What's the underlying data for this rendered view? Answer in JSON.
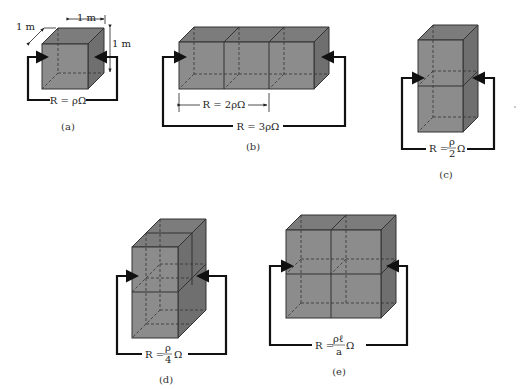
{
  "figure": {
    "panels": [
      {
        "id": "a",
        "caption": "(a)",
        "description": "single 1 m cube",
        "dimensions": {
          "width": "1 m",
          "depth": "1 m",
          "height": "1 m"
        },
        "resistance_label": "R = ρΩ"
      },
      {
        "id": "b",
        "caption": "(b)",
        "description": "three cubes in series",
        "inner_label": "R = 2ρΩ",
        "resistance_label": "R = 3ρΩ"
      },
      {
        "id": "c",
        "caption": "(c)",
        "description": "two cubes stacked in parallel",
        "resistance_label_prefix": "R =",
        "resistance_numerator": "ρ",
        "resistance_denominator": "2",
        "resistance_unit": "Ω"
      },
      {
        "id": "d",
        "caption": "(d)",
        "description": "four cubes in parallel (2 high × 2 deep)",
        "resistance_label_prefix": "R =",
        "resistance_numerator": "ρ",
        "resistance_denominator": "4",
        "resistance_unit": "Ω"
      },
      {
        "id": "e",
        "caption": "(e)",
        "description": "2×2 block of cubes",
        "resistance_label_prefix": "R =",
        "resistance_numerator": "ρℓ",
        "resistance_denominator": "a",
        "resistance_unit": "Ω"
      }
    ],
    "colors": {
      "block_fill": "#8c8c8c",
      "edge": "#333333",
      "wire": "#111111"
    }
  }
}
